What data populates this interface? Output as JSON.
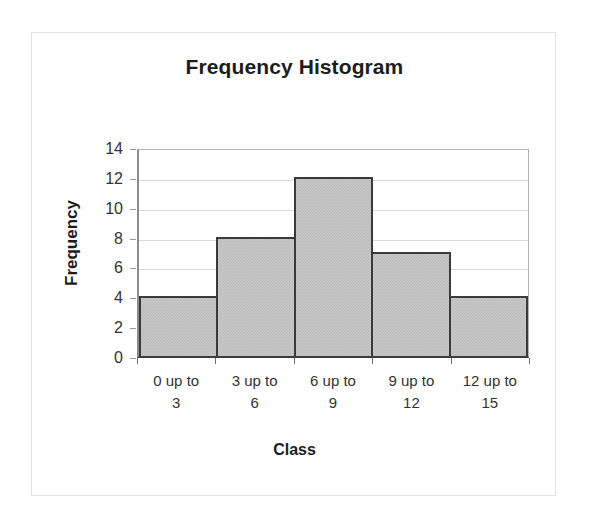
{
  "chart_data": {
    "type": "bar",
    "title": "Frequency Histogram",
    "xlabel": "Class",
    "ylabel": "Frequency",
    "categories": [
      "0 up to\n3",
      "3 up to\n6",
      "6 up to\n9",
      "9 up to\n12",
      "12 up to\n15"
    ],
    "category_lines": [
      [
        "0 up to",
        "3"
      ],
      [
        "3 up to",
        "6"
      ],
      [
        "6 up to",
        "9"
      ],
      [
        "9 up to",
        "12"
      ],
      [
        "12 up to",
        "15"
      ]
    ],
    "values": [
      4,
      8,
      12,
      7,
      4
    ],
    "ylim": [
      0,
      14
    ],
    "ytick_labels": [
      "0",
      "2",
      "4",
      "6",
      "8",
      "10",
      "12",
      "14"
    ],
    "ytick_values": [
      0,
      2,
      4,
      6,
      8,
      10,
      12,
      14
    ],
    "grid": true,
    "legend": false,
    "bar_fill_color": "#c8c8c8",
    "bar_border_color": "#3a3a3a",
    "gridline_color": "#dcdcdc",
    "plot_border_color": "#b4b4b4",
    "axis_color": "#3d3d3d",
    "frame_color": "#e2e2e2",
    "text_color": "#1d1d1d"
  }
}
